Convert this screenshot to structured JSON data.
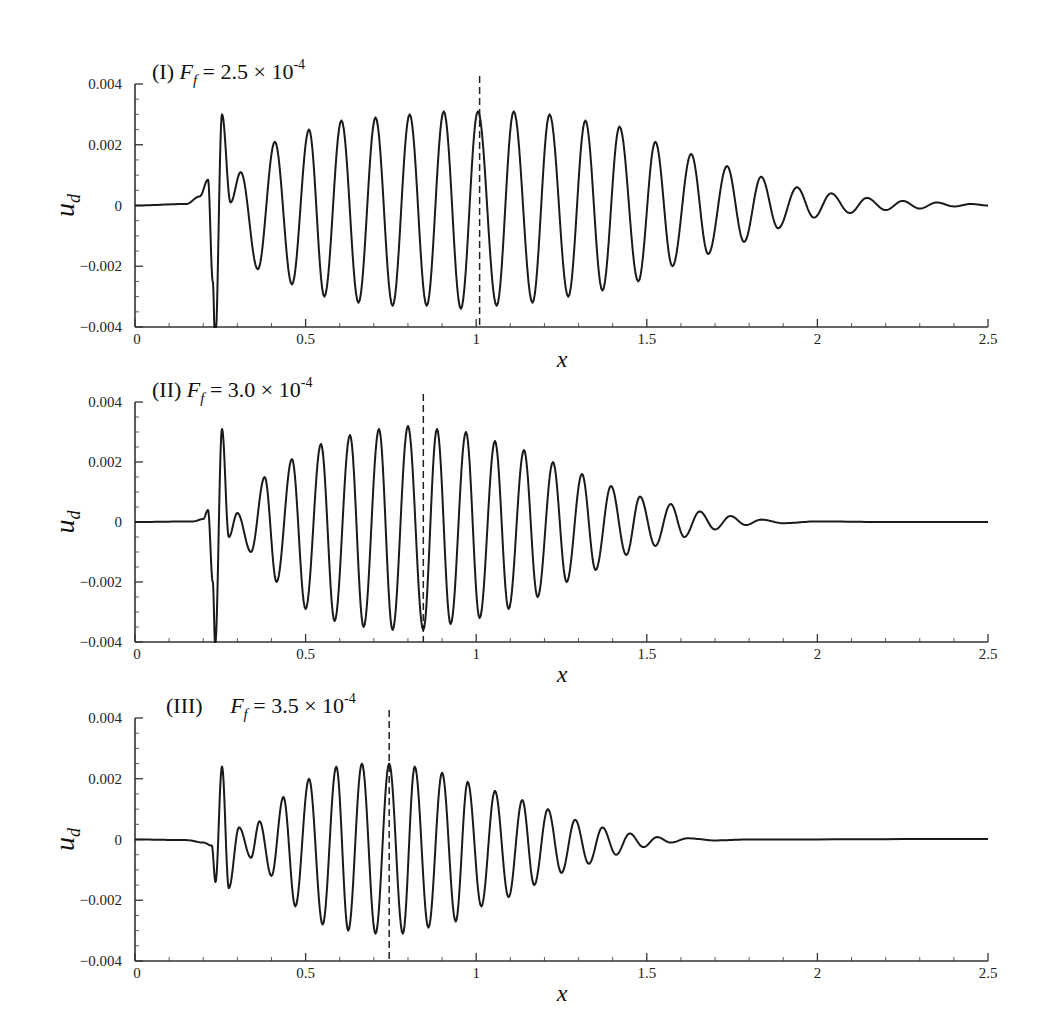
{
  "chart_data": [
    {
      "type": "line",
      "panel_label": "(I)",
      "title": "(I)  F_f = 2.5 × 10^-4",
      "title_parts": {
        "label": "(I)",
        "symbol": "F",
        "subscript": "f",
        "equals": "= 2.5 × 10",
        "exponent": "-4"
      },
      "xlabel": "x",
      "ylabel": "u_d",
      "ylabel_parts": {
        "symbol": "u",
        "subscript": "d"
      },
      "xlim": [
        0,
        2.5
      ],
      "ylim": [
        -0.004,
        0.004
      ],
      "xticks": [
        "0",
        "0.5",
        "1",
        "1.5",
        "2",
        "2.5"
      ],
      "yticks": [
        "0.004",
        "0.002",
        "0",
        "−0.002",
        "−0.004"
      ],
      "grid": false,
      "dashed_line_x": 1.01,
      "series": [
        {
          "name": "u_d",
          "points": [
            [
              0,
              0
            ],
            [
              0.15,
              5e-05
            ],
            [
              0.19,
              0.0003
            ],
            [
              0.214,
              0.00085
            ],
            [
              0.228,
              -0.0025
            ],
            [
              0.235,
              -0.0046
            ],
            [
              0.255,
              0.003
            ],
            [
              0.28,
              0.0001
            ],
            [
              0.31,
              0.0011
            ],
            [
              0.36,
              -0.0021
            ],
            [
              0.41,
              0.0021
            ],
            [
              0.46,
              -0.0026
            ],
            [
              0.51,
              0.0025
            ],
            [
              0.555,
              -0.003
            ],
            [
              0.605,
              0.0028
            ],
            [
              0.655,
              -0.0032
            ],
            [
              0.705,
              0.0029
            ],
            [
              0.755,
              -0.0033
            ],
            [
              0.805,
              0.003
            ],
            [
              0.855,
              -0.0033
            ],
            [
              0.905,
              0.0031
            ],
            [
              0.955,
              -0.0034
            ],
            [
              1.005,
              0.0031
            ],
            [
              1.06,
              -0.0033
            ],
            [
              1.11,
              0.0031
            ],
            [
              1.165,
              -0.0032
            ],
            [
              1.215,
              0.003
            ],
            [
              1.27,
              -0.003
            ],
            [
              1.32,
              0.0028
            ],
            [
              1.37,
              -0.0028
            ],
            [
              1.42,
              0.0026
            ],
            [
              1.475,
              -0.0025
            ],
            [
              1.525,
              0.0021
            ],
            [
              1.575,
              -0.002
            ],
            [
              1.63,
              0.0017
            ],
            [
              1.68,
              -0.0016
            ],
            [
              1.735,
              0.0013
            ],
            [
              1.785,
              -0.0012
            ],
            [
              1.835,
              0.00095
            ],
            [
              1.885,
              -0.00075
            ],
            [
              1.94,
              0.0006
            ],
            [
              1.99,
              -0.0004
            ],
            [
              2.04,
              0.0004
            ],
            [
              2.095,
              -0.00025
            ],
            [
              2.145,
              0.00025
            ],
            [
              2.2,
              -0.00015
            ],
            [
              2.25,
              0.00015
            ],
            [
              2.3,
              -0.0001
            ],
            [
              2.35,
              0.0001
            ],
            [
              2.4,
              -3e-05
            ],
            [
              2.45,
              5e-05
            ],
            [
              2.5,
              0.0
            ]
          ]
        }
      ]
    },
    {
      "type": "line",
      "panel_label": "(II)",
      "title": "(II)  F_f = 3.0 × 10^-4",
      "title_parts": {
        "label": "(II)",
        "symbol": "F",
        "subscript": "f",
        "equals": "= 3.0 × 10",
        "exponent": "-4"
      },
      "xlabel": "x",
      "ylabel": "u_d",
      "ylabel_parts": {
        "symbol": "u",
        "subscript": "d"
      },
      "xlim": [
        0,
        2.5
      ],
      "ylim": [
        -0.004,
        0.004
      ],
      "xticks": [
        "0",
        "0.5",
        "1",
        "1.5",
        "2",
        "2.5"
      ],
      "yticks": [
        "0.004",
        "0.002",
        "0",
        "−0.002",
        "−0.004"
      ],
      "grid": false,
      "dashed_line_x": 0.845,
      "series": [
        {
          "name": "u_d",
          "points": [
            [
              0,
              0
            ],
            [
              0.17,
              2e-05
            ],
            [
              0.2,
              0.0001
            ],
            [
              0.214,
              0.0004
            ],
            [
              0.228,
              -0.002
            ],
            [
              0.235,
              -0.0041
            ],
            [
              0.255,
              0.0031
            ],
            [
              0.275,
              -0.0005
            ],
            [
              0.3,
              0.0003
            ],
            [
              0.34,
              -0.001
            ],
            [
              0.38,
              0.0015
            ],
            [
              0.415,
              -0.002
            ],
            [
              0.46,
              0.0021
            ],
            [
              0.5,
              -0.0029
            ],
            [
              0.545,
              0.0026
            ],
            [
              0.585,
              -0.0033
            ],
            [
              0.63,
              0.0029
            ],
            [
              0.67,
              -0.0035
            ],
            [
              0.715,
              0.0031
            ],
            [
              0.755,
              -0.0036
            ],
            [
              0.8,
              0.0032
            ],
            [
              0.845,
              -0.0036
            ],
            [
              0.885,
              0.0031
            ],
            [
              0.925,
              -0.0034
            ],
            [
              0.97,
              0.003
            ],
            [
              1.01,
              -0.0032
            ],
            [
              1.055,
              0.0027
            ],
            [
              1.095,
              -0.0029
            ],
            [
              1.14,
              0.0024
            ],
            [
              1.18,
              -0.0025
            ],
            [
              1.225,
              0.002
            ],
            [
              1.265,
              -0.002
            ],
            [
              1.31,
              0.0016
            ],
            [
              1.35,
              -0.0016
            ],
            [
              1.395,
              0.0012
            ],
            [
              1.44,
              -0.0011
            ],
            [
              1.48,
              0.00085
            ],
            [
              1.525,
              -0.0008
            ],
            [
              1.57,
              0.0006
            ],
            [
              1.61,
              -0.0005
            ],
            [
              1.655,
              0.00035
            ],
            [
              1.7,
              -0.00025
            ],
            [
              1.745,
              0.0002
            ],
            [
              1.79,
              -0.0001
            ],
            [
              1.835,
              8e-05
            ],
            [
              1.9,
              -4e-05
            ],
            [
              2.0,
              2e-05
            ],
            [
              2.2,
              0.0
            ],
            [
              2.5,
              0.0
            ]
          ]
        }
      ]
    },
    {
      "type": "line",
      "panel_label": "(III)",
      "title": "(III)  F_f = 3.5 × 10^-4",
      "title_parts": {
        "label": "(III)",
        "symbol": "F",
        "subscript": "f",
        "equals": "= 3.5 × 10",
        "exponent": "-4"
      },
      "xlabel": "x",
      "ylabel": "u_d",
      "ylabel_parts": {
        "symbol": "u",
        "subscript": "d"
      },
      "xlim": [
        0,
        2.5
      ],
      "ylim": [
        -0.004,
        0.004
      ],
      "xticks": [
        "0",
        "0.5",
        "1",
        "1.5",
        "2",
        "2.5"
      ],
      "yticks": [
        "0.004",
        "0.002",
        "0",
        "−0.002",
        "−0.004"
      ],
      "grid": false,
      "dashed_line_x": 0.745,
      "series": [
        {
          "name": "u_d",
          "points": [
            [
              0,
              0
            ],
            [
              0.15,
              -2e-05
            ],
            [
              0.2,
              -0.0001
            ],
            [
              0.225,
              -0.0002
            ],
            [
              0.236,
              -0.0014
            ],
            [
              0.255,
              0.0024
            ],
            [
              0.275,
              -0.0016
            ],
            [
              0.305,
              0.0004
            ],
            [
              0.34,
              -0.0006
            ],
            [
              0.365,
              0.0006
            ],
            [
              0.4,
              -0.0012
            ],
            [
              0.435,
              0.0014
            ],
            [
              0.47,
              -0.0022
            ],
            [
              0.51,
              0.002
            ],
            [
              0.55,
              -0.0028
            ],
            [
              0.59,
              0.0024
            ],
            [
              0.625,
              -0.003
            ],
            [
              0.665,
              0.0025
            ],
            [
              0.705,
              -0.0031
            ],
            [
              0.745,
              0.0025
            ],
            [
              0.785,
              -0.0031
            ],
            [
              0.82,
              0.0024
            ],
            [
              0.86,
              -0.0029
            ],
            [
              0.9,
              0.0022
            ],
            [
              0.94,
              -0.0027
            ],
            [
              0.975,
              0.0019
            ],
            [
              1.015,
              -0.0022
            ],
            [
              1.055,
              0.0016
            ],
            [
              1.095,
              -0.0019
            ],
            [
              1.135,
              0.0013
            ],
            [
              1.17,
              -0.0015
            ],
            [
              1.21,
              0.001
            ],
            [
              1.25,
              -0.0011
            ],
            [
              1.29,
              0.00065
            ],
            [
              1.33,
              -0.0008
            ],
            [
              1.37,
              0.0004
            ],
            [
              1.41,
              -0.0005
            ],
            [
              1.45,
              0.0002
            ],
            [
              1.49,
              -0.00025
            ],
            [
              1.53,
              8e-05
            ],
            [
              1.57,
              -0.0001
            ],
            [
              1.62,
              4e-05
            ],
            [
              1.7,
              -3e-05
            ],
            [
              1.8,
              0.0
            ],
            [
              2.5,
              2e-05
            ]
          ]
        }
      ]
    }
  ],
  "panels": [
    {
      "top": 84,
      "bottom": 327
    },
    {
      "top": 402,
      "bottom": 642
    },
    {
      "top": 718,
      "bottom": 961
    }
  ],
  "colors": {
    "line": "#1a1a1a",
    "axis": "#333333",
    "dashed": "#222222"
  }
}
